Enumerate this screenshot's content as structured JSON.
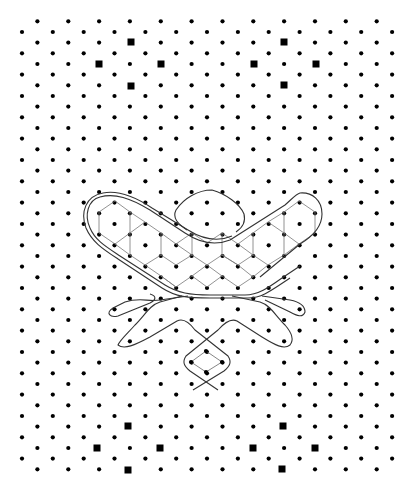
{
  "figure": {
    "background": "#ffffff",
    "dot_color": "#000000",
    "line_color": "#333333",
    "lattice_color": "#777777",
    "grid": {
      "x0": 22,
      "dx": 15.42,
      "y0": 21.3,
      "dy": 10.667,
      "rows": 43,
      "cols": 25,
      "dot_radius": 2.1
    },
    "markers": [
      {
        "x": 131,
        "y": 42
      },
      {
        "x": 99,
        "y": 64
      },
      {
        "x": 161,
        "y": 64
      },
      {
        "x": 131,
        "y": 86
      },
      {
        "x": 284,
        "y": 42
      },
      {
        "x": 254,
        "y": 64
      },
      {
        "x": 316,
        "y": 64
      },
      {
        "x": 284,
        "y": 85
      },
      {
        "x": 128,
        "y": 426
      },
      {
        "x": 97,
        "y": 448
      },
      {
        "x": 160,
        "y": 448
      },
      {
        "x": 128,
        "y": 470
      },
      {
        "x": 283,
        "y": 426
      },
      {
        "x": 253,
        "y": 448
      },
      {
        "x": 315,
        "y": 448
      },
      {
        "x": 282,
        "y": 469
      }
    ],
    "marker_size": 7,
    "lattice_edges": [
      [
        115,
        201,
        99,
        212
      ],
      [
        115,
        201,
        130,
        212
      ],
      [
        99,
        212,
        99,
        233
      ],
      [
        99,
        233,
        115,
        244
      ],
      [
        115,
        244,
        130,
        233
      ],
      [
        130,
        212,
        130,
        233
      ],
      [
        130,
        212,
        145,
        222
      ],
      [
        145,
        222,
        130,
        233
      ],
      [
        130,
        233,
        130,
        255
      ],
      [
        115,
        244,
        130,
        255
      ],
      [
        130,
        255,
        145,
        265
      ],
      [
        145,
        222,
        161,
        233
      ],
      [
        161,
        233,
        161,
        255
      ],
      [
        161,
        255,
        145,
        265
      ],
      [
        145,
        265,
        161,
        276
      ],
      [
        161,
        276,
        176,
        287
      ],
      [
        161,
        233,
        176,
        244
      ],
      [
        176,
        244,
        192,
        233
      ],
      [
        176,
        244,
        192,
        255
      ],
      [
        192,
        255,
        176,
        265
      ],
      [
        176,
        265,
        161,
        255
      ],
      [
        192,
        233,
        192,
        255
      ],
      [
        192,
        255,
        207,
        265
      ],
      [
        207,
        265,
        192,
        276
      ],
      [
        192,
        276,
        176,
        287
      ],
      [
        176,
        287,
        161,
        276
      ],
      [
        207,
        265,
        222,
        255
      ],
      [
        222,
        255,
        238,
        265
      ],
      [
        207,
        265,
        222,
        276
      ],
      [
        222,
        276,
        238,
        287
      ],
      [
        238,
        287,
        253,
        277
      ],
      [
        192,
        276,
        207,
        287
      ],
      [
        207,
        287,
        222,
        276
      ],
      [
        222,
        233,
        222,
        255
      ],
      [
        222,
        233,
        238,
        244
      ],
      [
        238,
        244,
        253,
        233
      ],
      [
        238,
        244,
        253,
        255
      ],
      [
        253,
        255,
        238,
        265
      ],
      [
        238,
        265,
        222,
        255
      ],
      [
        253,
        233,
        253,
        255
      ],
      [
        253,
        255,
        268,
        265
      ],
      [
        268,
        265,
        253,
        277
      ],
      [
        238,
        265,
        253,
        277
      ],
      [
        192,
        233,
        207,
        243
      ],
      [
        207,
        243,
        222,
        233
      ],
      [
        253,
        233,
        268,
        222
      ],
      [
        268,
        222,
        284,
        212
      ],
      [
        268,
        222,
        284,
        233
      ],
      [
        284,
        212,
        284,
        233
      ],
      [
        284,
        233,
        299,
        244
      ],
      [
        299,
        244,
        315,
        233
      ],
      [
        315,
        233,
        315,
        212
      ],
      [
        315,
        212,
        299,
        201
      ],
      [
        299,
        201,
        284,
        212
      ],
      [
        284,
        233,
        284,
        255
      ],
      [
        284,
        255,
        299,
        244
      ],
      [
        284,
        255,
        268,
        265
      ]
    ],
    "outlines": [
      "M 100 197 C 88 200, 84 215, 90 228 C 95 240, 105 246, 120 256 L 165 285 C 178 293, 190 295, 210 295 L 245 295 C 258 295, 268 288, 282 278 L 300 266",
      "M 103 193 C 86 196, 80 212, 86 228 C 92 242, 103 249, 118 259 L 162 288 C 176 297, 188 298, 210 298 L 248 298 C 262 298, 272 290, 290 278",
      "M 100 197 C 115 193, 130 198, 150 210 L 185 233 C 200 243, 215 246, 230 240 L 285 205 C 292 199, 296 194, 300 193 C 312 192, 322 200, 322 214 C 322 226, 315 235, 300 244 L 260 277",
      "M 103 193 C 118 190, 134 196, 152 208 L 188 230 C 204 240, 218 242, 232 236",
      "M 187 230 C 178 224, 172 218, 176 210 C 184 198, 198 190, 212 190 C 226 194, 240 204, 244 214 C 246 222, 242 228, 236 232",
      "M 182 296 L 160 302 C 150 305, 145 315, 135 325 C 128 333, 120 340, 118 345 C 124 350, 135 345, 150 337 L 177 321 C 183 318, 189 322, 195 330 L 228 356 C 232 362, 230 366, 224 371 L 193 390",
      "M 188 296 L 160 300 C 148 302, 140 297, 125 302 L 113 308 C 105 313, 110 318, 118 316 L 150 303 C 156 300, 157 296, 150 294",
      "M 232 296 L 260 302 C 270 305, 275 315, 285 325 C 292 333, 294 340, 290 345 C 284 350, 275 345, 262 337 L 237 321 C 231 318, 225 322, 218 330 L 186 356 C 182 362, 184 366, 190 371 L 218 390",
      "M 262 296 L 290 300 C 300 302, 305 306, 305 312 C 303 318, 297 316, 290 312 L 265 300"
    ],
    "inner_diamond": [
      [
        206,
        351
      ],
      [
        222,
        362
      ],
      [
        206,
        372
      ],
      [
        191,
        362
      ]
    ]
  }
}
